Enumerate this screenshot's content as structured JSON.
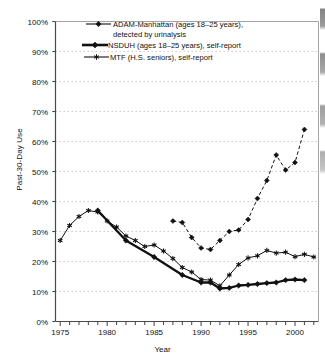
{
  "chart_data": {
    "type": "line",
    "title": "",
    "xlabel": "Year",
    "ylabel": "Past-30-Day Use",
    "xlim": [
      1974.5,
      2002.5
    ],
    "ylim": [
      0,
      100
    ],
    "grid": "horizontal-dashed",
    "legend_position": "inside-top-left",
    "y_ticks": [
      "0%",
      "10%",
      "20%",
      "30%",
      "40%",
      "50%",
      "60%",
      "70%",
      "80%",
      "90%",
      "100%"
    ],
    "y_tick_values": [
      0,
      10,
      20,
      30,
      40,
      50,
      60,
      70,
      80,
      90,
      100
    ],
    "x_ticks": [
      "1975",
      "1980",
      "1985",
      "1990",
      "1995",
      "2000"
    ],
    "x_tick_values": [
      1975,
      1980,
      1985,
      1990,
      1995,
      2000
    ],
    "x_minor_tick_interval": 1,
    "series": [
      {
        "name": "ADAM-Manhattan (ages 18–25 years), detected by urinalysis",
        "legend_label_line1": "ADAM-Manhattan (ages 18–25 years),",
        "legend_label_line2": "detected by urinalysis",
        "marker": "diamond",
        "line": "thin",
        "color": "#111111",
        "x": [
          1987,
          1988,
          1989,
          1990,
          1991,
          1992,
          1993,
          1994,
          1995,
          1996,
          1997,
          1998,
          1999,
          2000,
          2001
        ],
        "values": [
          33.5,
          33.0,
          28.0,
          24.5,
          24.0,
          27.0,
          30.0,
          30.5,
          34.0,
          41.0,
          47.0,
          55.5,
          50.5,
          53.0,
          64.0
        ]
      },
      {
        "name": "NSDUH (ages 18–25 years), self-report",
        "legend_label_line1": "NSDUH (ages 18–25 years), self-report",
        "marker": "diamond",
        "line": "thick",
        "color": "#111111",
        "x": [
          1979,
          1982,
          1985,
          1988,
          1990,
          1991,
          1992,
          1993,
          1994,
          1995,
          1996,
          1997,
          1998,
          1999,
          2000,
          2001
        ],
        "values": [
          37.0,
          27.0,
          21.5,
          15.5,
          13.0,
          13.0,
          11.0,
          11.2,
          12.0,
          12.2,
          12.5,
          12.8,
          13.0,
          13.8,
          14.0,
          13.8
        ]
      },
      {
        "name": "MTF (H.S. seniors), self-report",
        "legend_label_line1": "MTF (H.S. seniors), self-report",
        "marker": "asterisk",
        "line": "thin",
        "color": "#111111",
        "x": [
          1975,
          1976,
          1977,
          1978,
          1979,
          1980,
          1981,
          1982,
          1983,
          1984,
          1985,
          1986,
          1987,
          1988,
          1989,
          1990,
          1991,
          1992,
          1993,
          1994,
          1995,
          1996,
          1997,
          1998,
          1999,
          2000,
          2001,
          2002
        ],
        "values": [
          27.0,
          32.0,
          35.0,
          37.0,
          36.5,
          33.5,
          31.5,
          28.5,
          27.0,
          25.0,
          25.5,
          23.5,
          21.0,
          18.0,
          16.5,
          14.0,
          13.8,
          11.9,
          15.5,
          19.0,
          21.2,
          21.9,
          23.7,
          22.8,
          23.1,
          21.6,
          22.4,
          21.5
        ]
      }
    ]
  }
}
